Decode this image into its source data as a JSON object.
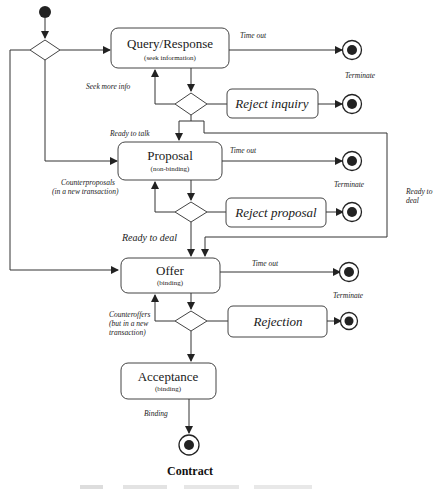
{
  "diagram": {
    "type": "UML activity diagram",
    "nodes": {
      "query": {
        "title": "Query/Response",
        "subtitle": "(seek information)"
      },
      "proposal": {
        "title": "Proposal",
        "subtitle": "(non-binding)"
      },
      "offer": {
        "title": "Offer",
        "subtitle": "(binding)"
      },
      "acceptance": {
        "title": "Acceptance",
        "subtitle": "(binding)"
      },
      "reject_inquiry": {
        "title": "Reject inquiry"
      },
      "reject_proposal": {
        "title": "Reject proposal"
      },
      "rejection": {
        "title": "Rejection"
      }
    },
    "edge_labels": {
      "query_timeout": "Time out",
      "query_terminate": "Terminate",
      "seek_more_info": "Seek  more info",
      "ready_to_talk": "Ready to talk",
      "proposal_timeout": "Time out",
      "proposal_terminate": "Terminate",
      "counterproposals_1": "Counterproposals",
      "counterproposals_2": "(in a new transaction)",
      "ready_to_deal_side_1": "Ready to",
      "ready_to_deal_side_2": "deal",
      "ready_to_deal": "Ready to deal",
      "offer_timeout": "Time out",
      "offer_terminate": "Terminate",
      "counteroffers_1": "Counteroffers",
      "counteroffers_2": "(but in a new",
      "counteroffers_3": "transaction)",
      "binding": "Binding"
    },
    "final_state_label": "Contract"
  }
}
